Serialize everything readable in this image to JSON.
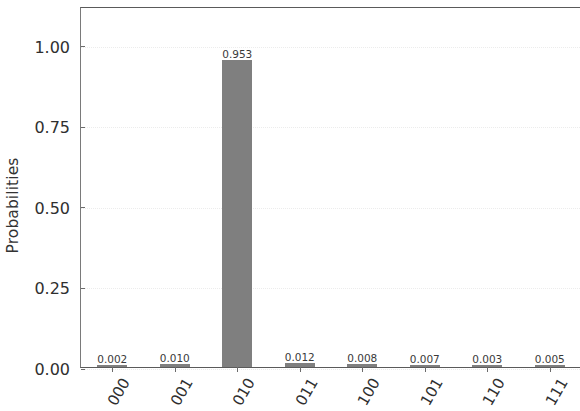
{
  "chart_data": {
    "type": "bar",
    "title": "",
    "xlabel": "",
    "ylabel": "Probabilities",
    "categories": [
      "000",
      "001",
      "010",
      "011",
      "100",
      "101",
      "110",
      "111"
    ],
    "values": [
      0.002,
      0.01,
      0.953,
      0.012,
      0.008,
      0.007,
      0.003,
      0.005
    ],
    "value_labels": [
      "0.002",
      "0.010",
      "0.953",
      "0.012",
      "0.008",
      "0.007",
      "0.003",
      "0.005"
    ],
    "ylim": [
      0,
      1.12
    ],
    "yticks": [
      0.0,
      0.25,
      0.5,
      0.75,
      1.0
    ],
    "ytick_labels": [
      "0.00",
      "0.25",
      "0.50",
      "0.75",
      "1.00"
    ],
    "grid": true,
    "grid_axis": "y",
    "legend": null,
    "bar_color": "#7f7f7f",
    "xtick_rotation_degrees": 60
  }
}
